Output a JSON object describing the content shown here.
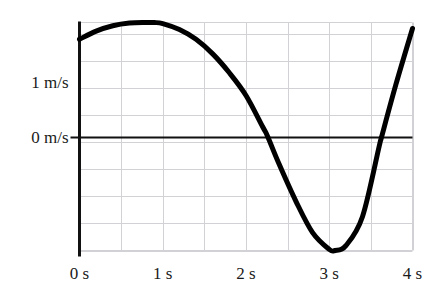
{
  "chart_data": {
    "type": "line",
    "title": "",
    "subtitle": "",
    "xlabel": "",
    "ylabel": "",
    "xlim": [
      0,
      4
    ],
    "ylim": [
      -2.111,
      2.111
    ],
    "grid": true,
    "grid_x_step": 0.5,
    "grid_y_step": 0.5,
    "legend": "none",
    "zero_line": 0,
    "x_unit": "s",
    "y_unit": "m/s",
    "x_tick_values": [
      0,
      1,
      2,
      3,
      4
    ],
    "x_tick_labels": [
      "0 s",
      "1 s",
      "2 s",
      "3 s",
      "4 s"
    ],
    "y_tick_values": [
      0,
      1
    ],
    "y_tick_labels": [
      "0 m/s",
      "1 m/s"
    ],
    "series": [
      {
        "name": "velocity",
        "color": "#000000",
        "line_width": 5,
        "x": [
          0.0,
          0.2,
          0.4,
          0.6,
          0.8,
          0.9,
          1.0,
          1.2,
          1.4,
          1.6,
          1.8,
          2.0,
          2.2,
          2.26,
          2.4,
          2.6,
          2.8,
          3.0,
          3.07,
          3.2,
          3.4,
          3.6,
          3.63,
          3.8,
          4.0
        ],
        "y": [
          1.8,
          1.95,
          2.05,
          2.1,
          2.11,
          2.11,
          2.09,
          1.98,
          1.8,
          1.53,
          1.18,
          0.76,
          0.18,
          0.0,
          -0.52,
          -1.2,
          -1.78,
          -2.09,
          -2.11,
          -2.02,
          -1.48,
          -0.18,
          0.0,
          0.96,
          2.0
        ]
      }
    ],
    "annotations": [],
    "key_points": {
      "start": {
        "x": 0,
        "y": 1.8
      },
      "maximum": {
        "x": 0.9,
        "y": 2.11
      },
      "first_zero_crossing": {
        "x": 2.26,
        "y": 0
      },
      "minimum": {
        "x": 3.07,
        "y": -2.11
      },
      "second_zero_crossing": {
        "x": 3.63,
        "y": 0
      },
      "end": {
        "x": 4.0,
        "y": 2.0
      }
    }
  },
  "axis": {
    "y_axis_name": "velocity-axis",
    "x_axis_name": "time-axis",
    "zero_line_name": "zero-velocity-line"
  }
}
